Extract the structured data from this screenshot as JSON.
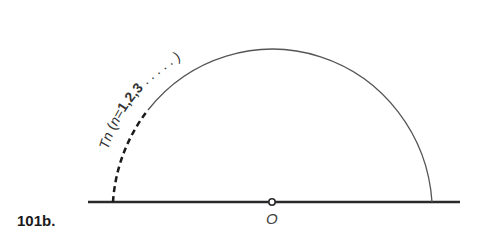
{
  "figure": {
    "label": "101b.",
    "origin_label": "O",
    "arc_label": {
      "prefix": "Tn",
      "open_paren": " (",
      "variable": "n",
      "equals": "=",
      "values": "1,2,3",
      "dots": " . . . . . ",
      "close_paren": ")"
    },
    "colors": {
      "line": "#2a2a2a",
      "arc": "#555555",
      "background": "#ffffff"
    }
  }
}
